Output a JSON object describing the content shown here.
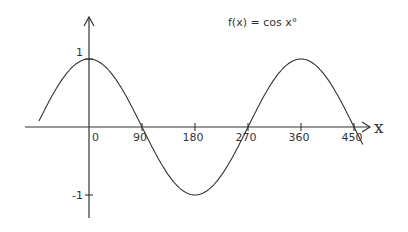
{
  "chart_data": {
    "type": "line",
    "title": "f(x) = cos x°",
    "xlabel": "x",
    "ylabel": "",
    "function": "cos(x degrees)",
    "xlim": [
      -85,
      465
    ],
    "ylim": [
      -1.2,
      1.2
    ],
    "x_ticks": [
      0,
      90,
      180,
      270,
      360,
      450
    ],
    "x_tick_labels": [
      "0",
      "90",
      "180",
      "270",
      "360",
      "450"
    ],
    "y_ticks": [
      1,
      -1
    ],
    "y_tick_labels": [
      "1",
      "-1"
    ],
    "grid": false,
    "series": [
      {
        "name": "cos x°",
        "x": [
          -85,
          -60,
          -30,
          0,
          30,
          60,
          90,
          120,
          150,
          180,
          210,
          240,
          270,
          300,
          330,
          360,
          390,
          420,
          450,
          465
        ],
        "y": [
          0.087,
          0.5,
          0.866,
          1,
          0.866,
          0.5,
          0,
          -0.5,
          -0.866,
          -1,
          -0.866,
          -0.5,
          0,
          0.5,
          0.866,
          1,
          0.866,
          0.5,
          0,
          -0.259
        ]
      }
    ]
  }
}
